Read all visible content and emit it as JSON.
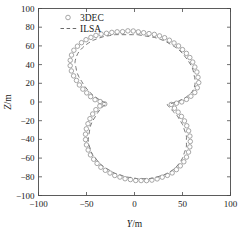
{
  "chart_data": {
    "type": "scatter",
    "title": "",
    "xlabel": "Y/m",
    "ylabel": "Z/m",
    "xlim": [
      -100,
      100
    ],
    "ylim": [
      -100,
      100
    ],
    "xticks": [
      -100,
      -50,
      0,
      50,
      100
    ],
    "yticks": [
      -100,
      -80,
      -60,
      -40,
      -20,
      0,
      20,
      40,
      60,
      80,
      100
    ],
    "xtick_labels": [
      "-100",
      "-50",
      "0",
      "50",
      "100"
    ],
    "ytick_labels": [
      "-100",
      "-80",
      "-60",
      "-40",
      "-20",
      "0",
      "20",
      "40",
      "60",
      "80",
      "100"
    ],
    "grid": false,
    "legend_position": "upper left",
    "series": [
      {
        "name": "3DEC",
        "marker": "open-circle",
        "linestyle": "none",
        "color": "#8a8a8a",
        "points": [
          [
            4,
            75
          ],
          [
            10,
            74
          ],
          [
            16,
            73
          ],
          [
            22,
            72
          ],
          [
            28,
            70
          ],
          [
            33,
            68
          ],
          [
            38,
            65
          ],
          [
            43,
            62
          ],
          [
            47,
            59
          ],
          [
            51,
            55
          ],
          [
            55,
            51
          ],
          [
            58,
            47
          ],
          [
            61,
            42
          ],
          [
            63,
            37
          ],
          [
            65,
            32
          ],
          [
            66,
            27
          ],
          [
            67,
            22
          ],
          [
            66,
            17
          ],
          [
            64,
            12
          ],
          [
            61,
            8
          ],
          [
            57,
            5
          ],
          [
            53,
            2
          ],
          [
            49,
            0
          ],
          [
            45,
            -1
          ],
          [
            41,
            -2
          ],
          [
            38,
            -3
          ],
          [
            41,
            -6
          ],
          [
            44,
            -9
          ],
          [
            47,
            -13
          ],
          [
            50,
            -17
          ],
          [
            53,
            -22
          ],
          [
            55,
            -27
          ],
          [
            57,
            -33
          ],
          [
            58,
            -39
          ],
          [
            58,
            -45
          ],
          [
            57,
            -51
          ],
          [
            55,
            -57
          ],
          [
            52,
            -63
          ],
          [
            48,
            -68
          ],
          [
            44,
            -72
          ],
          [
            39,
            -76
          ],
          [
            33,
            -79
          ],
          [
            27,
            -81
          ],
          [
            21,
            -83
          ],
          [
            14,
            -84
          ],
          [
            8,
            -84
          ],
          [
            2,
            -84
          ],
          [
            -4,
            -83
          ],
          [
            -10,
            -82
          ],
          [
            -16,
            -80
          ],
          [
            -22,
            -78
          ],
          [
            -27,
            -75
          ],
          [
            -32,
            -72
          ],
          [
            -37,
            -68
          ],
          [
            -41,
            -63
          ],
          [
            -45,
            -58
          ],
          [
            -48,
            -52
          ],
          [
            -50,
            -46
          ],
          [
            -51,
            -40
          ],
          [
            -51,
            -34
          ],
          [
            -50,
            -28
          ],
          [
            -48,
            -22
          ],
          [
            -46,
            -17
          ],
          [
            -43,
            -12
          ],
          [
            -40,
            -8
          ],
          [
            -37,
            -5
          ],
          [
            -34,
            -3
          ],
          [
            -31,
            -2
          ],
          [
            -34,
            0
          ],
          [
            -38,
            1
          ],
          [
            -42,
            3
          ],
          [
            -46,
            6
          ],
          [
            -50,
            10
          ],
          [
            -54,
            14
          ],
          [
            -58,
            19
          ],
          [
            -61,
            24
          ],
          [
            -64,
            29
          ],
          [
            -66,
            34
          ],
          [
            -67,
            39
          ],
          [
            -67,
            44
          ],
          [
            -66,
            49
          ],
          [
            -64,
            54
          ],
          [
            -61,
            58
          ],
          [
            -57,
            62
          ],
          [
            -53,
            65
          ],
          [
            -48,
            68
          ],
          [
            -43,
            70
          ],
          [
            -38,
            72
          ],
          [
            -32,
            73
          ],
          [
            -26,
            74
          ],
          [
            -20,
            75
          ],
          [
            -14,
            75
          ],
          [
            -8,
            76
          ],
          [
            -2,
            76
          ]
        ]
      },
      {
        "name": "ILSA",
        "marker": "none",
        "linestyle": "dashed",
        "color": "#6b6b6b",
        "points": [
          [
            3,
            72
          ],
          [
            9,
            71
          ],
          [
            15,
            70
          ],
          [
            21,
            69
          ],
          [
            27,
            67
          ],
          [
            32,
            65
          ],
          [
            37,
            62
          ],
          [
            42,
            59
          ],
          [
            46,
            56
          ],
          [
            50,
            52
          ],
          [
            53,
            48
          ],
          [
            56,
            44
          ],
          [
            59,
            39
          ],
          [
            61,
            34
          ],
          [
            62,
            29
          ],
          [
            63,
            24
          ],
          [
            63,
            19
          ],
          [
            62,
            15
          ],
          [
            60,
            11
          ],
          [
            56,
            7
          ],
          [
            52,
            4
          ],
          [
            48,
            2
          ],
          [
            44,
            0
          ],
          [
            40,
            -1
          ],
          [
            37,
            -2
          ],
          [
            34,
            -3
          ],
          [
            37,
            -6
          ],
          [
            40,
            -10
          ],
          [
            44,
            -14
          ],
          [
            47,
            -19
          ],
          [
            50,
            -24
          ],
          [
            52,
            -30
          ],
          [
            54,
            -36
          ],
          [
            54,
            -42
          ],
          [
            54,
            -48
          ],
          [
            52,
            -54
          ],
          [
            50,
            -60
          ],
          [
            47,
            -65
          ],
          [
            43,
            -70
          ],
          [
            38,
            -74
          ],
          [
            33,
            -77
          ],
          [
            27,
            -79
          ],
          [
            21,
            -81
          ],
          [
            15,
            -82
          ],
          [
            9,
            -82
          ],
          [
            3,
            -82
          ],
          [
            -3,
            -81
          ],
          [
            -9,
            -80
          ],
          [
            -15,
            -78
          ],
          [
            -21,
            -76
          ],
          [
            -26,
            -73
          ],
          [
            -31,
            -70
          ],
          [
            -36,
            -66
          ],
          [
            -40,
            -61
          ],
          [
            -44,
            -56
          ],
          [
            -46,
            -50
          ],
          [
            -48,
            -44
          ],
          [
            -48,
            -38
          ],
          [
            -47,
            -32
          ],
          [
            -46,
            -26
          ],
          [
            -44,
            -21
          ],
          [
            -41,
            -16
          ],
          [
            -38,
            -11
          ],
          [
            -35,
            -7
          ],
          [
            -32,
            -4
          ],
          [
            -29,
            -2
          ],
          [
            -32,
            0
          ],
          [
            -36,
            2
          ],
          [
            -40,
            5
          ],
          [
            -44,
            8
          ],
          [
            -48,
            12
          ],
          [
            -52,
            17
          ],
          [
            -55,
            22
          ],
          [
            -58,
            27
          ],
          [
            -60,
            32
          ],
          [
            -61,
            37
          ],
          [
            -62,
            42
          ],
          [
            -61,
            47
          ],
          [
            -59,
            52
          ],
          [
            -56,
            56
          ],
          [
            -52,
            60
          ],
          [
            -48,
            63
          ],
          [
            -43,
            66
          ],
          [
            -38,
            68
          ],
          [
            -32,
            70
          ],
          [
            -26,
            71
          ],
          [
            -20,
            72
          ],
          [
            -14,
            72
          ],
          [
            -8,
            72
          ],
          [
            -2,
            72
          ]
        ]
      }
    ],
    "legend": [
      {
        "label": "3DEC",
        "symbol": "open-circle"
      },
      {
        "label": "ILSA",
        "symbol": "dashed-line"
      }
    ]
  },
  "legend": {
    "items": [
      {
        "label": "3DEC"
      },
      {
        "label": "ILSA"
      }
    ]
  },
  "axes": {
    "x_title": "Y",
    "x_unit": "/m",
    "y_title": "Z",
    "y_unit": "/m"
  }
}
